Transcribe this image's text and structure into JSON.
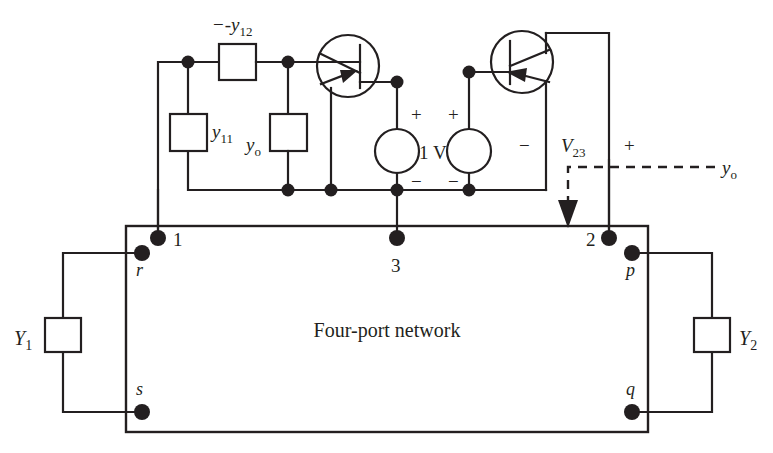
{
  "diagram": {
    "network_label": "Four-port network",
    "colors": {
      "ink": "#231f20",
      "background": "#ffffff"
    }
  },
  "components": {
    "series_admittance": {
      "label": "-y",
      "sub": "12",
      "name": "minus-y12-box"
    },
    "input_admittance": {
      "label": "y",
      "sub": "11",
      "name": "y11-box"
    },
    "output_admittance": {
      "label": "y",
      "sub": "o",
      "name": "yo-box"
    },
    "load_left": {
      "label": "Y",
      "sub": "1",
      "name": "Y1-box"
    },
    "load_right": {
      "label": "Y",
      "sub": "2",
      "name": "Y2-box"
    },
    "source_value": "1 V",
    "voltage_label": {
      "label": "V",
      "sub": "23"
    },
    "annotation_admittance": {
      "label": "y",
      "sub": "o"
    }
  },
  "polarity": {
    "left_source_plus": "+",
    "left_source_minus": "−",
    "right_source_plus": "+",
    "right_source_minus": "−",
    "v23_minus": "−",
    "v23_plus": "+"
  },
  "terminals": {
    "ports": [
      {
        "id": "1",
        "label": "1",
        "x": 158,
        "y": 238
      },
      {
        "id": "3",
        "label": "3",
        "x": 397,
        "y": 238
      },
      {
        "id": "2",
        "label": "2",
        "x": 609,
        "y": 238
      }
    ],
    "corners": [
      {
        "id": "r",
        "label": "r",
        "x": 142,
        "y": 253
      },
      {
        "id": "s",
        "label": "s",
        "x": 142,
        "y": 412
      },
      {
        "id": "p",
        "label": "p",
        "x": 632,
        "y": 253
      },
      {
        "id": "q",
        "label": "q",
        "x": 632,
        "y": 412
      }
    ]
  },
  "transistors": [
    {
      "name": "left-transistor",
      "cx": 348,
      "cy": 66,
      "r": 31,
      "arrow": "inward-right"
    },
    {
      "name": "right-transistor",
      "cx": 522,
      "cy": 62,
      "r": 31,
      "arrow": "inward-left"
    }
  ]
}
